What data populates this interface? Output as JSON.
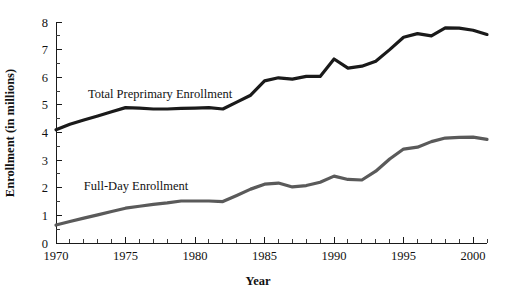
{
  "chart_data": {
    "type": "line",
    "title": "",
    "subtitle": "",
    "xlabel": "Year",
    "ylabel": "Enrollment (in millions)",
    "xlim": [
      1970,
      2001
    ],
    "ylim": [
      0,
      8
    ],
    "grid": false,
    "legend_position": "inline-annotation",
    "x_tick_labels": [
      "1970",
      "1975",
      "1980",
      "1985",
      "1990",
      "1995",
      "2000"
    ],
    "x_tick_label_values": [
      1970,
      1975,
      1980,
      1985,
      1990,
      1995,
      2000
    ],
    "x_minor_tick_interval": 1,
    "y_tick_labels": [
      "0",
      "1",
      "2",
      "3",
      "4",
      "5",
      "6",
      "7",
      "8"
    ],
    "y_tick_label_values": [
      0,
      1,
      2,
      3,
      4,
      5,
      6,
      7,
      8
    ],
    "y_minor_tick_interval": 0.5,
    "x": [
      1970,
      1971,
      1972,
      1973,
      1974,
      1975,
      1976,
      1977,
      1978,
      1979,
      1980,
      1981,
      1982,
      1983,
      1984,
      1985,
      1986,
      1987,
      1988,
      1989,
      1990,
      1991,
      1992,
      1993,
      1994,
      1995,
      1996,
      1997,
      1998,
      1999,
      2000,
      2001
    ],
    "series": [
      {
        "name": "Total Preprimary Enrollment",
        "color": "#1a1a1a",
        "line_width": 3.2,
        "label_x": 1972.3,
        "label_y": 5.25,
        "values": [
          4.1,
          4.3,
          4.45,
          4.6,
          4.75,
          4.9,
          4.88,
          4.85,
          4.85,
          4.87,
          4.88,
          4.9,
          4.85,
          5.1,
          5.35,
          5.87,
          5.98,
          5.93,
          6.03,
          6.03,
          6.66,
          6.33,
          6.4,
          6.58,
          7.0,
          7.45,
          7.58,
          7.5,
          7.79,
          7.78,
          7.7,
          7.55
        ]
      },
      {
        "name": "Full-Day Enrollment",
        "color": "#5a5a5a",
        "line_width": 3.2,
        "label_x": 1972.0,
        "label_y": 1.93,
        "values": [
          0.65,
          0.78,
          0.9,
          1.02,
          1.14,
          1.26,
          1.33,
          1.4,
          1.45,
          1.52,
          1.52,
          1.52,
          1.5,
          1.72,
          1.95,
          2.13,
          2.17,
          2.03,
          2.08,
          2.2,
          2.42,
          2.3,
          2.28,
          2.6,
          3.04,
          3.4,
          3.47,
          3.67,
          3.8,
          3.82,
          3.83,
          3.75
        ]
      }
    ]
  },
  "figure": {
    "background_color": "#ffffff",
    "plot_left_px": 56,
    "plot_right_px": 487,
    "plot_top_px": 22,
    "plot_bottom_px": 243
  }
}
